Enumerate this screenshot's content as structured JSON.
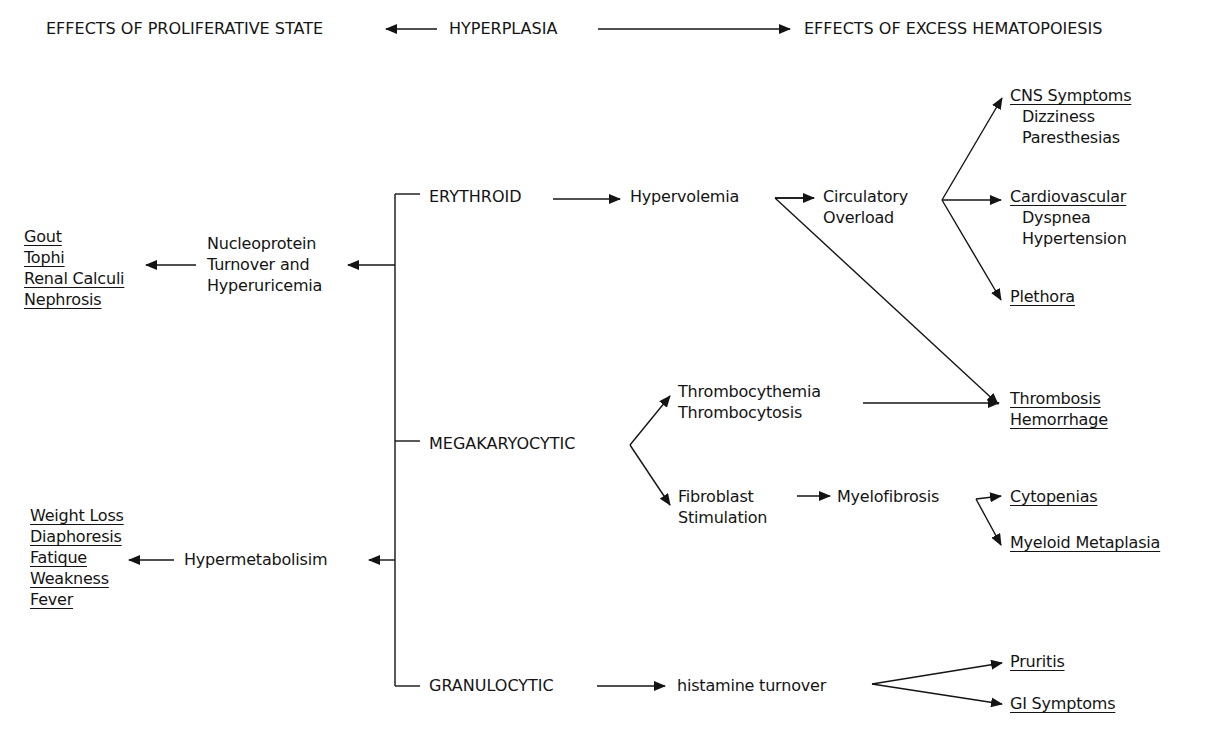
{
  "header": {
    "left": "EFFECTS OF PROLIFERATIVE STATE",
    "center": "HYPERPLASIA",
    "right": "EFFECTS OF EXCESS HEMATOPOIESIS"
  },
  "left_effects": {
    "nucleoprotein": {
      "cause": [
        "Nucleoprotein",
        "Turnover and",
        "Hyperuricemia"
      ],
      "effects": [
        "Gout",
        "Tophi",
        "Renal Calculi",
        "Nephrosis"
      ]
    },
    "hypermetabolism": {
      "cause": "Hypermetabolisim",
      "effects": [
        "Weight Loss",
        "Diaphoresis",
        "Fatique",
        "Weakness",
        "Fever"
      ]
    }
  },
  "lineages": {
    "erythroid": {
      "label": "ERYTHROID",
      "step1": "Hypervolemia",
      "step2": [
        "Circulatory",
        "Overload"
      ],
      "outcomes": {
        "cns": {
          "title": "CNS Symptoms",
          "items": [
            "Dizziness",
            "Paresthesias"
          ]
        },
        "cardio": {
          "title": "Cardiovascular",
          "items": [
            "Dyspnea",
            "Hypertension"
          ]
        },
        "plethora": {
          "title": "Plethora"
        }
      }
    },
    "megakaryocytic": {
      "label": "MEGAKARYOCYTIC",
      "upper": [
        "Thrombocythemia",
        "Thrombocytosis"
      ],
      "upper_outcome": [
        "Thrombosis",
        "Hemorrhage"
      ],
      "lower": [
        "Fibroblast",
        "Stimulation"
      ],
      "lower_step2": "Myelofibrosis",
      "lower_outcomes": [
        "Cytopenias",
        "Myeloid Metaplasia"
      ]
    },
    "granulocytic": {
      "label": "GRANULOCYTIC",
      "step1": "histamine turnover",
      "outcomes": [
        "Pruritis",
        "GI Symptoms"
      ]
    }
  }
}
